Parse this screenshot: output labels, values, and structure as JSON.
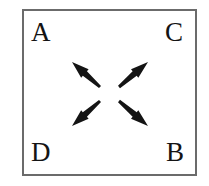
{
  "figure": {
    "name": "four-corner-outward-arrow-diagram",
    "background_color": "#ffffff",
    "frame": {
      "border_color": "#6b6b6b",
      "border_width_px": 2,
      "fill_color": "#ffffff",
      "x": 22,
      "y": 9,
      "width": 175,
      "height": 167
    },
    "text_color": "#141414",
    "corner_labels": [
      {
        "id": "A",
        "text": "A",
        "position": "top-left"
      },
      {
        "id": "C",
        "text": "C",
        "position": "top-right"
      },
      {
        "id": "D",
        "text": "D",
        "position": "bottom-left"
      },
      {
        "id": "B",
        "text": "B",
        "position": "bottom-right"
      }
    ],
    "arrows": [
      {
        "id": "arrow-up-left",
        "points_toward": "A",
        "direction": "up-left",
        "tail_x": 100,
        "tail_y": 87,
        "head_x": 72,
        "head_y": 62,
        "color": "#141414"
      },
      {
        "id": "arrow-up-right",
        "points_toward": "C",
        "direction": "up-right",
        "tail_x": 119,
        "tail_y": 87,
        "head_x": 148,
        "head_y": 62,
        "color": "#141414"
      },
      {
        "id": "arrow-down-left",
        "points_toward": "D",
        "direction": "down-left",
        "tail_x": 100,
        "tail_y": 101,
        "head_x": 72,
        "head_y": 126,
        "color": "#141414"
      },
      {
        "id": "arrow-down-right",
        "points_toward": "B",
        "direction": "down-right",
        "tail_x": 119,
        "tail_y": 101,
        "head_x": 148,
        "head_y": 126,
        "color": "#141414"
      }
    ]
  }
}
